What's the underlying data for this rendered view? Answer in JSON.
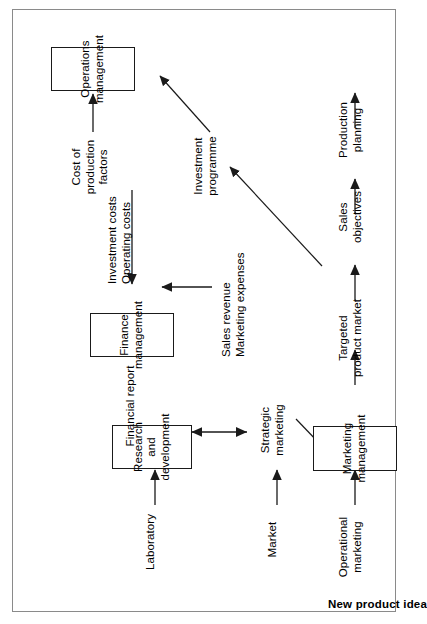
{
  "diagram": {
    "title": "New product idea",
    "type": "flowchart",
    "orientation": "rotated-90-ccw",
    "nodes": [
      {
        "id": "rnd",
        "label": "Research and\ndevelopment",
        "shape": "rectangle"
      },
      {
        "id": "operations",
        "label": "Operations\nmanagement",
        "shape": "rectangle"
      },
      {
        "id": "marketing",
        "label": "Marketing\nmanagement",
        "shape": "rectangle"
      },
      {
        "id": "finance",
        "label": "Finance\nmanagement",
        "shape": "rectangle"
      }
    ],
    "labels": [
      {
        "id": "market",
        "text": "Market"
      },
      {
        "id": "laboratory",
        "text": "Laboratory"
      },
      {
        "id": "strategic_marketing",
        "text": "Strategic\nmarketing"
      },
      {
        "id": "operational_marketing",
        "text": "Operational\nmarketing"
      },
      {
        "id": "targeted_market",
        "text": "Targeted\nproduct market"
      },
      {
        "id": "sales_objectives",
        "text": "Sales\nobjectives"
      },
      {
        "id": "production_planning",
        "text": "Production\nplanning"
      },
      {
        "id": "investment_programme",
        "text": "Investment\nprogramme"
      },
      {
        "id": "cost_production",
        "text": "Cost of\nproduction\nfactors"
      },
      {
        "id": "investment_costs",
        "text": "Investment costs\nOperating costs"
      },
      {
        "id": "sales_revenue",
        "text": "Sales revenue\nMarketing expenses"
      },
      {
        "id": "financial_report",
        "text": "Financial report"
      }
    ],
    "edges": [
      {
        "from": "market",
        "to": "strategic_marketing",
        "style": "single"
      },
      {
        "from": "laboratory",
        "to": "rnd",
        "style": "single"
      },
      {
        "from": "strategic_marketing",
        "to": "rnd",
        "style": "double"
      },
      {
        "from": "strategic_marketing",
        "to": "marketing",
        "style": "single-diagonal"
      },
      {
        "from": "operational_marketing",
        "to": "marketing",
        "style": "single"
      },
      {
        "from": "marketing",
        "to": "targeted_market",
        "style": "single"
      },
      {
        "from": "targeted_market",
        "to": "sales_objectives",
        "style": "single"
      },
      {
        "from": "sales_objectives",
        "to": "production_planning",
        "style": "single"
      },
      {
        "from": "production_planning",
        "to": "operations",
        "style": "single"
      },
      {
        "from": "targeted_market",
        "to": "investment_programme",
        "style": "single-diagonal"
      },
      {
        "from": "investment_programme",
        "to": "operations",
        "style": "single-diagonal"
      },
      {
        "from": "cost_production",
        "to": "operations",
        "style": "single"
      },
      {
        "from": "investment_costs",
        "to": "finance",
        "style": "single"
      },
      {
        "from": "sales_revenue",
        "to": "finance",
        "style": "single"
      },
      {
        "from": "finance",
        "to": "financial_report",
        "style": "single"
      }
    ],
    "colors": {
      "stroke": "#1a1a1a",
      "text": "#000000",
      "background": "#ffffff",
      "frame": "#8a8a8a"
    }
  }
}
